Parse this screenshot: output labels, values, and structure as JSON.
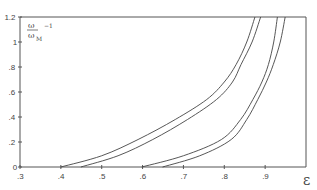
{
  "chart_data": {
    "type": "line",
    "title": "",
    "xlabel": "ε",
    "ylabel_numerator": "ω",
    "ylabel_denominator": "ω",
    "ylabel_subscript": "M",
    "ylabel_suffix": "−1",
    "xlim": [
      0.3,
      1.0
    ],
    "ylim": [
      0,
      1.2
    ],
    "x_ticks": [
      0.3,
      0.4,
      0.5,
      0.6,
      0.7,
      0.8,
      0.9
    ],
    "x_tick_labels": [
      ".3",
      ".4",
      ".5",
      ".6",
      ".7",
      ".8",
      ".9"
    ],
    "y_ticks": [
      0,
      0.2,
      0.4,
      0.6,
      0.8,
      1.0,
      1.2
    ],
    "y_tick_labels": [
      "0",
      ".2",
      ".4",
      ".6",
      ".8",
      "1",
      "1.2"
    ],
    "grid": false,
    "legend": "none",
    "series": [
      {
        "name": "curve-1",
        "x": [
          0.4,
          0.5,
          0.589,
          0.68,
          0.757,
          0.8,
          0.829,
          0.855,
          0.875
        ],
        "y": [
          0,
          0.09,
          0.22,
          0.38,
          0.54,
          0.68,
          0.82,
          1.0,
          1.2
        ]
      },
      {
        "name": "curve-2",
        "x": [
          0.449,
          0.54,
          0.625,
          0.71,
          0.781,
          0.82,
          0.841,
          0.868,
          0.889
        ],
        "y": [
          0,
          0.09,
          0.22,
          0.38,
          0.54,
          0.68,
          0.82,
          1.0,
          1.2
        ]
      },
      {
        "name": "curve-3",
        "x": [
          0.598,
          0.7,
          0.793,
          0.84,
          0.87,
          0.892,
          0.908,
          0.921,
          0.93
        ],
        "y": [
          0,
          0.09,
          0.22,
          0.38,
          0.54,
          0.68,
          0.82,
          1.0,
          1.2
        ]
      },
      {
        "name": "curve-4",
        "x": [
          0.649,
          0.74,
          0.817,
          0.855,
          0.882,
          0.903,
          0.92,
          0.937,
          0.949
        ],
        "y": [
          0,
          0.09,
          0.22,
          0.38,
          0.54,
          0.68,
          0.82,
          1.0,
          1.2
        ]
      }
    ]
  }
}
